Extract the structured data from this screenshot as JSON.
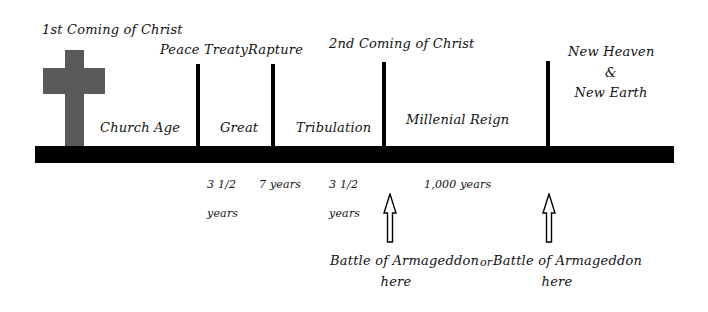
{
  "diagram": {
    "colors": {
      "bar": "#000000",
      "cross": "#5a5a5a",
      "background": "#ffffff"
    },
    "events_above": {
      "first_coming": "1st Coming of Christ",
      "peace_treaty": "Peace Treaty",
      "rapture": "Rapture",
      "second_coming": "2nd Coming of Christ",
      "new_heaven_line1": "New Heaven",
      "new_heaven_amp": "&",
      "new_heaven_line2": "New Earth"
    },
    "periods": {
      "church_age": "Church Age",
      "great": "Great",
      "tribulation": "Tribulation",
      "millenial_reign": "Millenial Reign"
    },
    "durations": {
      "first_half_num": "3 1/2",
      "first_half_unit": "years",
      "total": "7 years",
      "second_half_num": "3 1/2",
      "second_half_unit": "years",
      "millennium": "1,000 years"
    },
    "armageddon": {
      "option1_line1": "Battle of Armageddon",
      "option1_line2": "here",
      "connector": "or",
      "option2_line1": "Battle of Armageddon",
      "option2_line2": "here"
    },
    "icons": [
      "cross-icon",
      "up-arrow-icon",
      "up-arrow-icon"
    ]
  }
}
